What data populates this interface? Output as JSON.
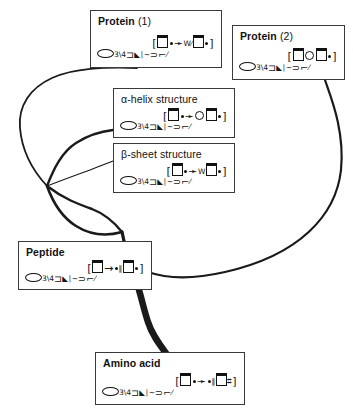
{
  "diagram": {
    "type": "hierarchical-tree-diagram",
    "title_visible": false,
    "background_color": "#ffffff",
    "line_color": "#1a1a1a",
    "box_border_color": "#3a3a3a"
  },
  "nodes": [
    {
      "id": "protein-1",
      "title_bold": "Protein",
      "title_rest": " (1)",
      "x": 90,
      "y": 10,
      "w": 132,
      "h": 58,
      "symbols_top": "[ ▤ ☞ ᵂ ⁄ ▤ • ]",
      "symbols_bottom": "◯ ₃\\₄ ⊃ ▸∣ ~ ⊃ ⌐ ⁄"
    },
    {
      "id": "protein-2",
      "title_bold": "Protein",
      "title_rest": " (2)",
      "x": 232,
      "y": 25,
      "w": 113,
      "h": 55,
      "symbols_top": "[ ▤ ◯ ▤ • ]",
      "symbols_bottom": "◯ ₃\\₄ ⊃ ▸∣ ~ ⊃ ⌐ ⁄"
    },
    {
      "id": "alpha-helix",
      "title_bold": "",
      "title_rest": "α-helix structure",
      "x": 113,
      "y": 88,
      "w": 122,
      "h": 50,
      "symbols_top": "[ ▤ ☞ ◯ ▤ • ]",
      "symbols_bottom": "◯ ₃\\₄ ⊃ ▸∣ ~ ⊃ ⌐ ⁄"
    },
    {
      "id": "beta-sheet",
      "title_bold": "",
      "title_rest": "β-sheet structure",
      "x": 113,
      "y": 143,
      "w": 122,
      "h": 50,
      "symbols_top": "[ ▤ ☞ ᵂ ▤ • ]",
      "symbols_bottom": "◯ ₃\\₄ ⊃ ▸∣ ~ ⊃ ⌐ ⁄"
    },
    {
      "id": "peptide",
      "title_bold": "Peptide",
      "title_rest": "",
      "x": 18,
      "y": 241,
      "w": 134,
      "h": 49,
      "symbols_top": "[ ▤ → • ‖ ▤ • ]",
      "symbols_bottom": "◯ ₃\\₄ ⊃ ▸∣ ~ ⊃ ⌐ ⁄"
    },
    {
      "id": "amino-acid",
      "title_bold": "Amino acid",
      "title_rest": "",
      "x": 95,
      "y": 352,
      "w": 150,
      "h": 53,
      "symbols_top": "[ ▤ ☞ • ‖ ▤ ⌗ ]",
      "symbols_bottom": "◯ ₃\\₄ ⊃ ▸∣ ~ ⊃ ⌐ ⁄"
    }
  ],
  "branches": [
    {
      "id": "trunk-amino-to-peptide",
      "from": "amino-acid",
      "to": "peptide",
      "weight": "thick"
    },
    {
      "id": "peptide-to-fork",
      "from": "peptide",
      "to": "fork",
      "weight": "medium"
    },
    {
      "id": "fork-to-protein-1",
      "from": "fork",
      "to": "protein-1",
      "weight": "medium"
    },
    {
      "id": "fork-to-alpha-helix",
      "from": "fork",
      "to": "alpha-helix",
      "weight": "medium"
    },
    {
      "id": "fork-to-beta-sheet",
      "from": "fork",
      "to": "beta-sheet",
      "weight": "thin"
    },
    {
      "id": "trunk-to-protein-2",
      "from": "amino-acid",
      "to": "protein-2",
      "weight": "medium"
    }
  ]
}
